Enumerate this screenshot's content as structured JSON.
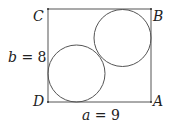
{
  "diagram": {
    "title": "",
    "rectangle": {
      "x": 48,
      "y": 9,
      "width": 103,
      "height": 93,
      "stroke": "#555555"
    },
    "circles": [
      {
        "name": "lower-left",
        "cx": 76.5,
        "cy": 73.5,
        "r": 28.5
      },
      {
        "name": "upper-right",
        "cx": 122.5,
        "cy": 38,
        "r": 28.5
      }
    ],
    "vertices": {
      "C": {
        "label": "C",
        "x": 48,
        "y": 9
      },
      "B": {
        "label": "B",
        "x": 151,
        "y": 9
      },
      "D": {
        "label": "D",
        "x": 48,
        "y": 102
      },
      "A": {
        "label": "A",
        "x": 151,
        "y": 102
      }
    },
    "side_labels": {
      "width": {
        "var": "a",
        "eq": " = ",
        "value": "9"
      },
      "height": {
        "var": "b",
        "eq": " = ",
        "value": "8"
      }
    }
  }
}
